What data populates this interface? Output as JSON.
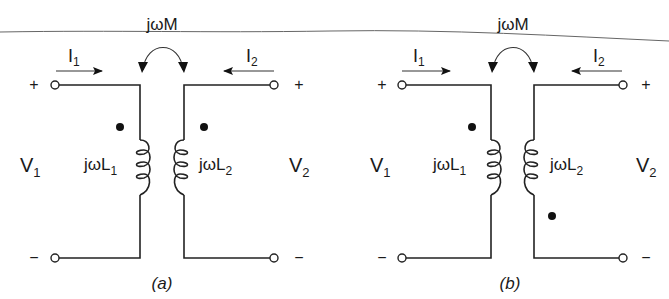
{
  "figure": {
    "top_rule": true,
    "colors": {
      "ink": "#1a1a1a",
      "background": "#ffffff"
    }
  },
  "panels": [
    {
      "id": "a",
      "caption": "(a)",
      "mutual_label": "jωM",
      "current_left": {
        "symbol": "I",
        "subscript": "1"
      },
      "current_right": {
        "symbol": "I",
        "subscript": "2"
      },
      "voltage_left": {
        "symbol": "V",
        "subscript": "1"
      },
      "voltage_right": {
        "symbol": "V",
        "subscript": "2"
      },
      "inductor_left": {
        "prefix": "jωL",
        "subscript": "1"
      },
      "inductor_right": {
        "prefix": "jωL",
        "subscript": "2"
      },
      "polarity_top_left": "+",
      "polarity_top_right": "+",
      "polarity_bottom_left": "−",
      "polarity_bottom_right": "−",
      "dot_convention": [
        "top-left-coil",
        "top-right-coil"
      ]
    },
    {
      "id": "b",
      "caption": "(b)",
      "mutual_label": "jωM",
      "current_left": {
        "symbol": "I",
        "subscript": "1"
      },
      "current_right": {
        "symbol": "I",
        "subscript": "2"
      },
      "voltage_left": {
        "symbol": "V",
        "subscript": "1"
      },
      "voltage_right": {
        "symbol": "V",
        "subscript": "2"
      },
      "inductor_left": {
        "prefix": "jωL",
        "subscript": "1"
      },
      "inductor_right": {
        "prefix": "jωL",
        "subscript": "2"
      },
      "polarity_top_left": "+",
      "polarity_top_right": "+",
      "polarity_bottom_left": "−",
      "polarity_bottom_right": "−",
      "dot_convention": [
        "top-left-coil",
        "bottom-right-coil"
      ]
    }
  ]
}
